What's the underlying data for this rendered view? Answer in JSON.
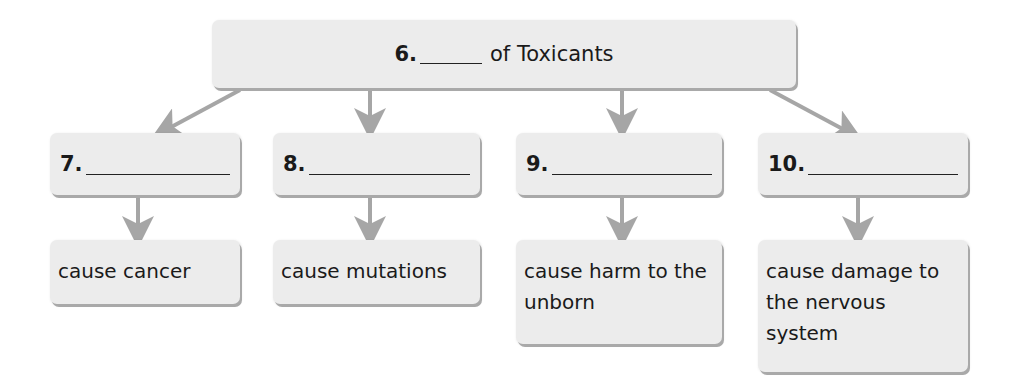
{
  "title": {
    "number": "6.",
    "text": "of Toxicants"
  },
  "categories": [
    {
      "number": "7.",
      "description": "cause cancer"
    },
    {
      "number": "8.",
      "description": "cause mutations"
    },
    {
      "number": "9.",
      "description": "cause harm to the unborn"
    },
    {
      "number": "10.",
      "description": "cause damage to the nervous system"
    }
  ],
  "colors": {
    "box_fill": "#ececec",
    "box_shadow": "#a9a9a9",
    "arrow": "#a6a6a6",
    "text": "#1a1a1a"
  }
}
